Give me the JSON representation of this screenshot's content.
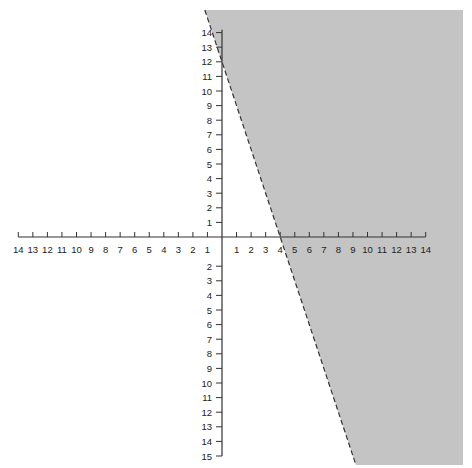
{
  "chart_data": {
    "type": "area",
    "title": "",
    "xlabel": "",
    "ylabel": "",
    "xlim": [
      -14,
      14
    ],
    "ylim": [
      -15,
      14
    ],
    "grid": false,
    "x_ticks_negative": [
      "14",
      "13",
      "12",
      "11",
      "10",
      "9",
      "8",
      "7",
      "6",
      "5",
      "4",
      "3",
      "2",
      "1"
    ],
    "x_ticks_positive": [
      "1",
      "2",
      "3",
      "4",
      "5",
      "6",
      "7",
      "8",
      "9",
      "10",
      "11",
      "12",
      "13",
      "14"
    ],
    "y_ticks_positive": [
      "14",
      "13",
      "12",
      "11",
      "10",
      "9",
      "8",
      "7",
      "6",
      "5",
      "4",
      "3",
      "2",
      "1"
    ],
    "y_ticks_negative": [
      "2",
      "3",
      "4",
      "5",
      "6",
      "7",
      "8",
      "9",
      "10",
      "11",
      "12",
      "13",
      "14",
      "15"
    ],
    "boundary_line": {
      "equation": "y = -3x + 12",
      "style": "dashed",
      "points": [
        {
          "x": 0,
          "y": 12
        },
        {
          "x": 4,
          "y": 0
        }
      ],
      "slope": -3,
      "y_intercept": 12,
      "x_intercept": 4
    },
    "shaded_region": {
      "inequality": "3x + y > 12",
      "side": "right of boundary",
      "color": "#c4c4c4"
    }
  },
  "colors": {
    "shade": "#c4c4c4",
    "axis": "#333333",
    "line": "#333333"
  }
}
